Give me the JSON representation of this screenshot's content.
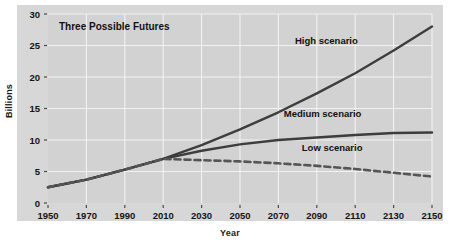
{
  "chart_data": {
    "type": "line",
    "title": "Three Possible Futures",
    "xlabel": "Year",
    "ylabel": "Billions",
    "xlim": [
      1950,
      2150
    ],
    "ylim": [
      0,
      30
    ],
    "grid": true,
    "legend_position": "inline-annotations",
    "x_ticks": [
      1950,
      1970,
      1990,
      2010,
      2030,
      2050,
      2070,
      2090,
      2110,
      2130,
      2150
    ],
    "y_ticks": [
      0,
      5,
      10,
      15,
      20,
      25,
      30
    ],
    "x": [
      1950,
      1970,
      1990,
      2010,
      2030,
      2050,
      2070,
      2090,
      2110,
      2130,
      2150
    ],
    "series": [
      {
        "name": "High scenario",
        "style": "solid",
        "color": "#3d3d3d",
        "values": [
          2.5,
          3.7,
          5.3,
          7.0,
          9.2,
          11.7,
          14.4,
          17.4,
          20.6,
          24.2,
          28.0
        ]
      },
      {
        "name": "Medium scenario",
        "style": "solid",
        "color": "#3d3d3d",
        "values": [
          2.5,
          3.7,
          5.3,
          7.0,
          8.3,
          9.3,
          10.0,
          10.4,
          10.8,
          11.1,
          11.2
        ]
      },
      {
        "name": "Low scenario",
        "style": "dashed",
        "color": "#555555",
        "values": [
          2.5,
          3.7,
          5.3,
          7.0,
          6.8,
          6.6,
          6.3,
          5.9,
          5.4,
          4.8,
          4.2
        ]
      }
    ],
    "annotations": [
      {
        "text": "High scenario",
        "x": 2095,
        "y": 25.3
      },
      {
        "text": "Medium scenario",
        "x": 2093,
        "y": 13.6
      },
      {
        "text": "Low scenario",
        "x": 2098,
        "y": 8.3
      }
    ],
    "colors": {
      "card_background": "#d7d7d7",
      "plot_background": "#d2d2d2",
      "gridline": "#f2f2f2",
      "line": "#3d3d3d",
      "text": "#111111"
    }
  }
}
